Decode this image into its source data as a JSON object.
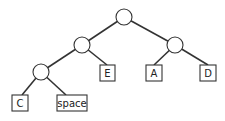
{
  "diagram": {
    "type": "binary-tree",
    "internal_nodes": [
      {
        "id": "root",
        "cx": 124,
        "cy": 17
      },
      {
        "id": "n-left",
        "cx": 82,
        "cy": 45
      },
      {
        "id": "n-right",
        "cx": 175,
        "cy": 45
      },
      {
        "id": "n-left-left",
        "cx": 41,
        "cy": 72
      }
    ],
    "leaves": [
      {
        "id": "leaf-e",
        "label": "E",
        "x": 100,
        "y": 65,
        "w": 15,
        "h": 16,
        "parent": "n-left"
      },
      {
        "id": "leaf-a",
        "label": "A",
        "x": 146,
        "y": 65,
        "w": 16,
        "h": 16,
        "parent": "n-right"
      },
      {
        "id": "leaf-d",
        "label": "D",
        "x": 200,
        "y": 65,
        "w": 16,
        "h": 16,
        "parent": "n-right"
      },
      {
        "id": "leaf-c",
        "label": "C",
        "x": 12,
        "y": 95,
        "w": 16,
        "h": 16,
        "parent": "n-left-left"
      },
      {
        "id": "leaf-space",
        "label": "space",
        "x": 57,
        "y": 95,
        "w": 30,
        "h": 16,
        "parent": "n-left-left"
      }
    ]
  }
}
